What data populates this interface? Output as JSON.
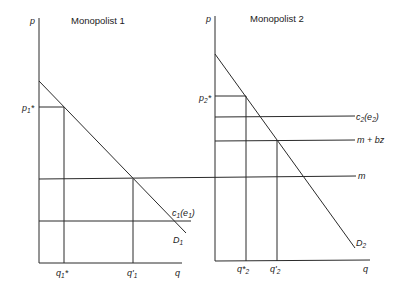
{
  "diagram": {
    "panels": [
      {
        "title": "Monopolist 1",
        "y_axis_label": "p",
        "x_axis_label": "q",
        "demand_label": "D",
        "demand_sub": "1",
        "price_label": "p",
        "price_sub": "1",
        "price_star": "*",
        "cost_label": "c",
        "cost_sub": "1",
        "cost_arg": "(e",
        "cost_arg_sub": "1",
        "cost_close": ")",
        "q_star_label": "q",
        "q_star_sub": "1",
        "q_star_mark": "*",
        "q_prime_label": "q'",
        "q_prime_sub": "1"
      },
      {
        "title": "Monopolist 2",
        "y_axis_label": "p",
        "x_axis_label": "q",
        "demand_label": "D",
        "demand_sub": "2",
        "price_label": "p",
        "price_sub": "2",
        "price_star": "*",
        "cost_label": "c",
        "cost_sub": "2",
        "cost_arg": "(e",
        "cost_arg_sub": "2",
        "cost_close": ")",
        "mbz_label": "m + bz",
        "m_label": "m",
        "q_star_label": "q*",
        "q_star_sub": "2",
        "q_prime_label": "q'",
        "q_prime_sub": "2"
      }
    ]
  }
}
